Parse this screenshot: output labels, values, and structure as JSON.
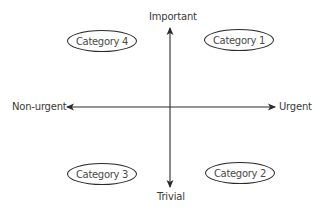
{
  "diagram": {
    "axes": {
      "top": "Important",
      "bottom": "Trivial",
      "left": "Non-urgent",
      "right": "Urgent"
    },
    "categories": [
      {
        "label": "Category 1",
        "quadrant": "top-right"
      },
      {
        "label": "Category 2",
        "quadrant": "bottom-right"
      },
      {
        "label": "Category 3",
        "quadrant": "bottom-left"
      },
      {
        "label": "Category 4",
        "quadrant": "top-left"
      }
    ],
    "colors": {
      "line": "#2a2a2a",
      "text": "#3a3a3a",
      "background": "#ffffff"
    }
  }
}
